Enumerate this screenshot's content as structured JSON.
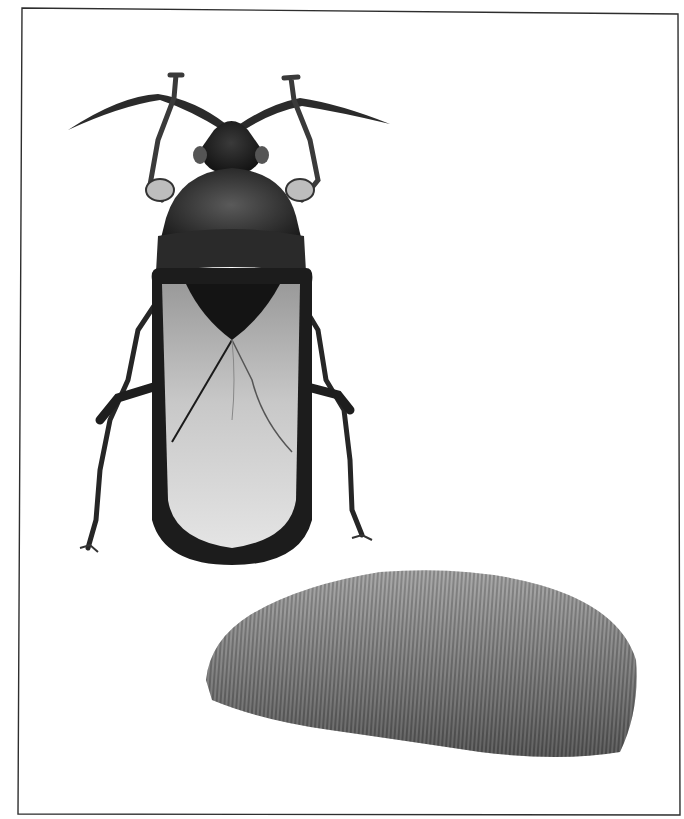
{
  "image": {
    "subject": "scientific illustration",
    "description": "Grayscale stipple drawing of an insect (dorsal view) and a hairy mass, inside a thin rectangular border",
    "colors": {
      "background": "#ffffff",
      "frame": "#333333",
      "body_dark": "#1e1e1e",
      "body_mid": "#3a3a3a",
      "wing_light": "#d8d8d8",
      "wing_mid": "#a8a8a8",
      "hair_mass": "#7a7a7a"
    }
  }
}
